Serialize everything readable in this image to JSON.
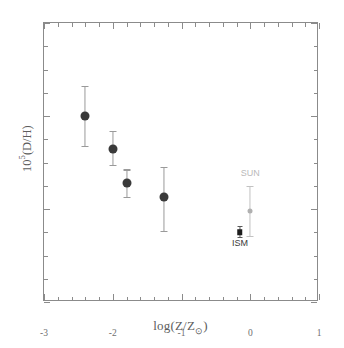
{
  "chart_data": {
    "type": "scatter",
    "title": "",
    "xlabel": "log(Z/Z⊙)",
    "ylabel": "10⁵(D/H)",
    "xlim": [
      -3,
      1
    ],
    "ylim": [
      0,
      6
    ],
    "grid": false,
    "legend": "none",
    "xticks": [
      -3,
      -2,
      -1,
      0,
      1
    ],
    "xtick_labels": [
      "-3",
      "-2",
      "-1",
      "0",
      "1"
    ],
    "yticks": [
      0,
      2,
      4,
      6
    ],
    "ytick_labels": [
      "0",
      "2",
      "4",
      "6"
    ],
    "x_minor_tick_interval": 0.2,
    "y_minor_tick_interval": 0.5,
    "series": [
      {
        "name": "absorption-system-measurements",
        "marker": "filled-circle",
        "color": "#3a3a3a",
        "errorbar_color": "#9a9a9a",
        "points": [
          {
            "x": -2.4,
            "y": 4.0,
            "yerr_up": 0.65,
            "yerr_down": 0.65
          },
          {
            "x": -2.0,
            "y": 3.3,
            "yerr_up": 0.38,
            "yerr_down": 0.35
          },
          {
            "x": -1.8,
            "y": 2.55,
            "yerr_up": 0.3,
            "yerr_down": 0.3
          },
          {
            "x": -1.25,
            "y": 2.25,
            "yerr_up": 0.65,
            "yerr_down": 0.72
          }
        ]
      },
      {
        "name": "ism-measurement",
        "marker": "filled-square",
        "color": "#1d1d1d",
        "errorbar_color": "#5a5a5a",
        "label": "ISM",
        "points": [
          {
            "x": -0.15,
            "y": 1.5,
            "yerr_up": 0.14,
            "yerr_down": 0.1
          }
        ]
      },
      {
        "name": "sun-measurement",
        "marker": "filled-circle-small",
        "color": "#b0b0b0",
        "errorbar_color": "#c2c2c2",
        "label": "SUN",
        "points": [
          {
            "x": 0.0,
            "y": 1.95,
            "yerr_up": 0.55,
            "yerr_down": 0.52
          }
        ]
      }
    ],
    "annotations": [
      {
        "text": "ISM",
        "x": -0.15,
        "y": 1.25,
        "color": "#3a3a3a"
      },
      {
        "text": "SUN",
        "x": 0.0,
        "y": 2.75,
        "color": "#b9b9b9"
      }
    ]
  },
  "figure": {
    "background_color": "#ffffff",
    "axis_color": "#8b8b8b",
    "tick_label_color": "#6f6f6f",
    "axis_label_color": "#5d5d5d",
    "ylabel_mantissa": "10",
    "ylabel_exponent": "5",
    "ylabel_suffix": "(D/H)",
    "xlabel_prefix": "log(Z/Z",
    "xlabel_sun_symbol": "⊙",
    "xlabel_suffix": ")"
  }
}
